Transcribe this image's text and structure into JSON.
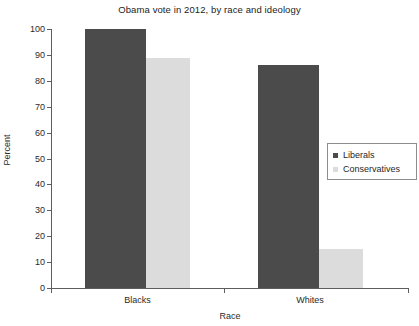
{
  "chart_data": {
    "type": "bar",
    "title": "Obama vote in 2012, by race and ideology",
    "xlabel": "Race",
    "ylabel": "Percent",
    "categories": [
      "Blacks",
      "Whites"
    ],
    "series": [
      {
        "name": "Liberals",
        "values": [
          100,
          86
        ],
        "color": "#4b4b4b"
      },
      {
        "name": "Conservatives",
        "values": [
          89,
          15
        ],
        "color": "#dcdcdc"
      }
    ],
    "ylim": [
      0,
      100
    ],
    "yticks": [
      0,
      10,
      20,
      30,
      40,
      50,
      60,
      70,
      80,
      90,
      100
    ],
    "ytick_labels": [
      "0",
      "10",
      "20",
      "30",
      "40",
      "50",
      "60",
      "70",
      "80",
      "90",
      "100"
    ],
    "grid": false,
    "legend_position": "right-middle"
  },
  "legend": {
    "entries": [
      {
        "label": "Liberals",
        "swatch": "dark-square-swatch"
      },
      {
        "label": "Conservatives",
        "swatch": "light-square-swatch"
      }
    ]
  }
}
